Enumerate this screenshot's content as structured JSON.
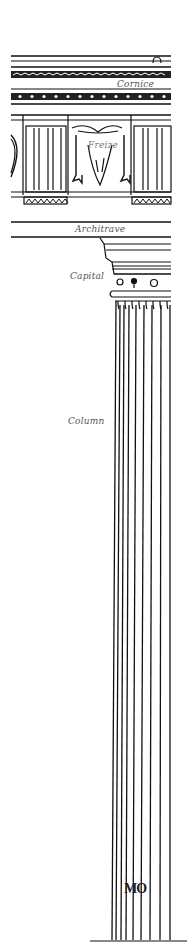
{
  "figure": {
    "labels": {
      "cornice": "Cornice",
      "frieze": "Freize",
      "architrave": "Architrave",
      "capital": "Capital",
      "column": "Column"
    },
    "monogram": "MO",
    "colors": {
      "ink": "#111111",
      "label": "#555555",
      "background": "#ffffff"
    }
  }
}
